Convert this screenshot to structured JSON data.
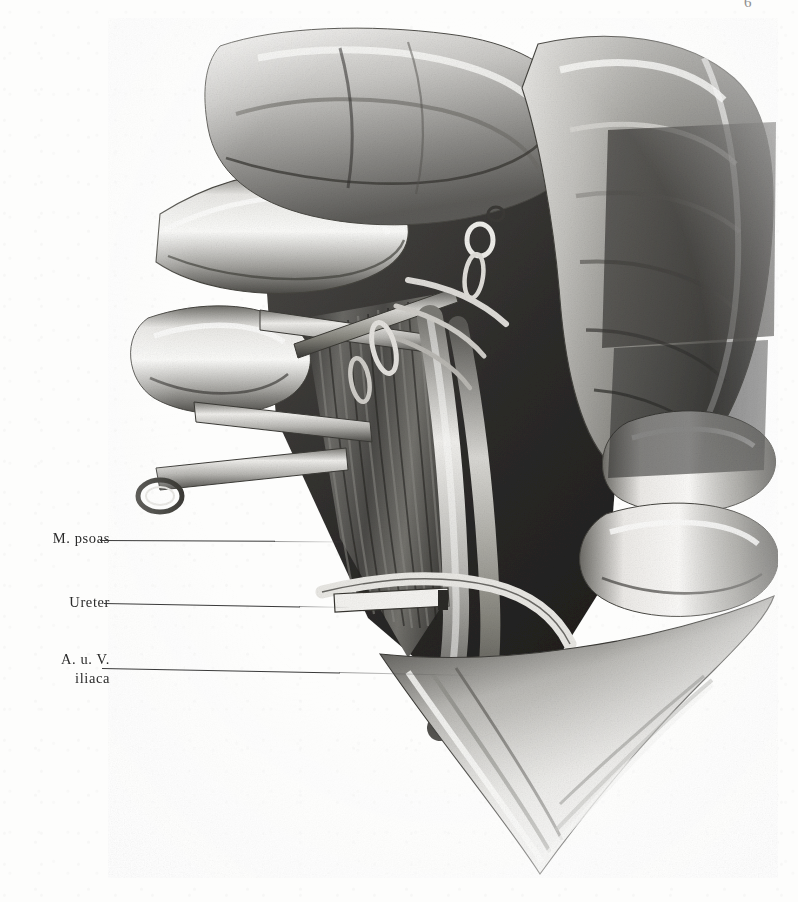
{
  "page": {
    "background_color": "#fdfdfc",
    "width": 798,
    "height": 902,
    "corner_artifact": "6"
  },
  "plate": {
    "kind": "anatomical-halftone-illustration",
    "description": "Grayscale surgical dissection illustration of the retroperitoneal iliac region; reflected abdominal wall flaps, exposed psoas muscle, ureter held by a clamp, and iliac artery and vein.",
    "ink_color": "#2b2b2b",
    "tone_light": "#f2f1ef",
    "tone_mid": "#9a9a98",
    "tone_dark": "#3c3c3a",
    "tone_darkest": "#1e1e1d"
  },
  "labels": [
    {
      "id": "m-psoas",
      "line1": "M. psoas",
      "line2": "",
      "leader_from_x": 100,
      "leader_to_x": 352,
      "leader_y": 540
    },
    {
      "id": "ureter",
      "line1": "Ureter",
      "line2": "",
      "leader_from_x": 104,
      "leader_to_x": 349,
      "leader_y": 603
    },
    {
      "id": "a-u-v-iliaca",
      "line1": "A. u. V.",
      "line2": "iliaca",
      "leader_from_x": 102,
      "leader_to_x": 471,
      "leader_y": 668
    }
  ]
}
